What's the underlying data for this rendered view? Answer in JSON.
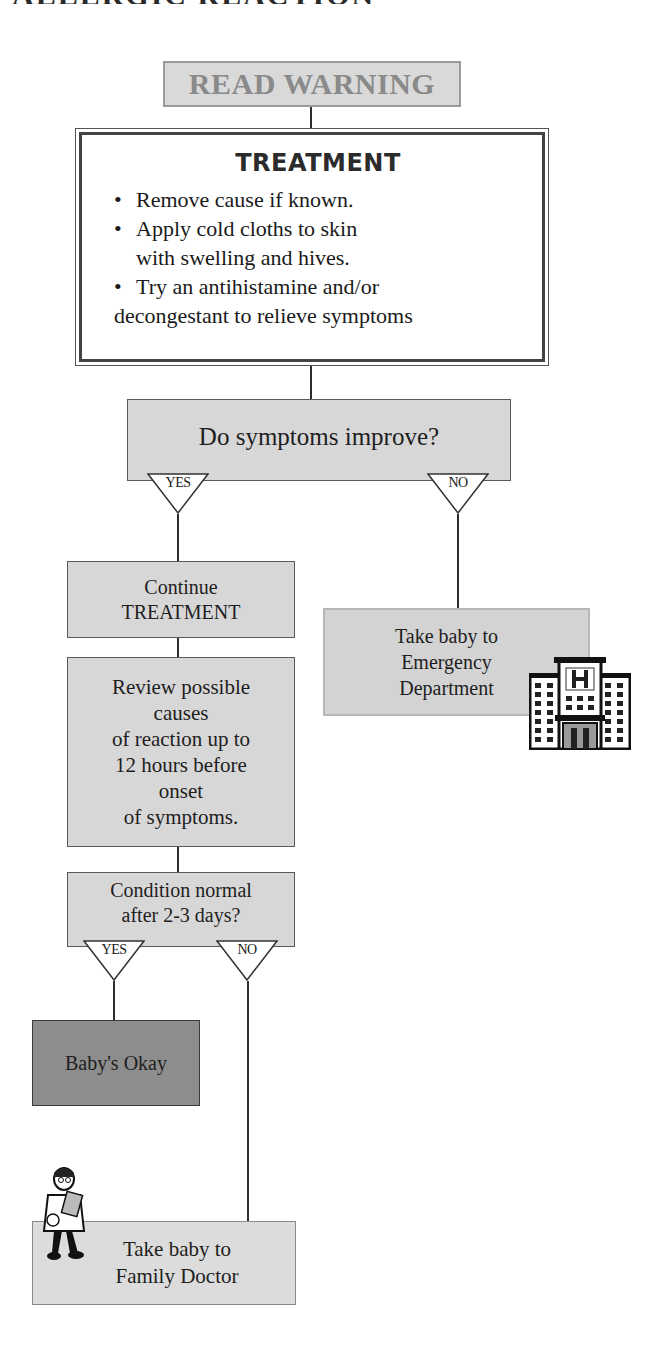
{
  "title": {
    "part1": "ALLERGIC REACTION",
    "part2": ""
  },
  "flowchart": {
    "start": {
      "label": "READ WARNING"
    },
    "treatment": {
      "title": "TREATMENT",
      "steps": [
        "Remove cause if known.",
        "Apply cold cloths to skin with swelling and hives.",
        "Try an antihistamine and/or decongestant to relieve symptoms"
      ],
      "step_lines": [
        [
          "Remove cause if known."
        ],
        [
          "Apply cold cloths to skin",
          "with swelling and hives."
        ],
        [
          "Try an antihistamine and/or",
          "decongestant to relieve symptoms"
        ]
      ]
    },
    "decision1": {
      "question": "Do symptoms improve?",
      "yes_label": "YES",
      "no_label": "NO"
    },
    "continue_box": {
      "line1": "Continue",
      "line2": "TREATMENT"
    },
    "review_box": {
      "lines": [
        "Review possible",
        "causes",
        "of reaction up to",
        "12 hours before",
        "onset",
        "of symptoms."
      ]
    },
    "emergency_box": {
      "lines": [
        "Take baby to",
        "Emergency",
        "Department"
      ],
      "icon": "hospital-icon"
    },
    "decision2": {
      "line1": "Condition normal",
      "line2": "after 2-3 days?",
      "yes_label": "YES",
      "no_label": "NO"
    },
    "okay_box": {
      "label": "Baby's Okay"
    },
    "family_box": {
      "lines": [
        "Take baby to",
        "Family Doctor"
      ],
      "icon": "doctor-icon"
    }
  },
  "colors": {
    "box_fill": "#d7d7d7",
    "okay_fill": "#8d8d8d",
    "line": "#2e2e2e",
    "warning_text": "#8a8a8a"
  }
}
